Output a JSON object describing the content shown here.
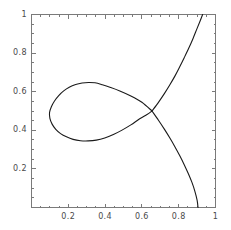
{
  "figure": {
    "title": "",
    "frame_color": "#7a7a7a",
    "curve_color": "#1a1a1a",
    "background": "#ffffff",
    "tick_label_color": "#4a4a4a"
  },
  "chart_data": {
    "type": "line",
    "title": "",
    "xlabel": "",
    "ylabel": "",
    "xlim": [
      0,
      1
    ],
    "ylim": [
      0,
      1
    ],
    "grid": false,
    "legend": null,
    "xticks": [
      0.2,
      0.4,
      0.6,
      0.8,
      1
    ],
    "xtick_labels": [
      "0.2",
      "0.4",
      "0.6",
      "0.8",
      "1"
    ],
    "yticks": [
      0.2,
      0.4,
      0.6,
      0.8,
      1
    ],
    "ytick_labels": [
      "0.2",
      "0.4",
      "0.6",
      "0.8",
      "1"
    ],
    "annotations": [
      {
        "name": "self-intersection",
        "x": 0.655,
        "y": 0.5
      },
      {
        "name": "loop-leftmost",
        "x": 0.09,
        "y": 0.49
      },
      {
        "name": "loop-top",
        "x": 0.325,
        "y": 0.648
      },
      {
        "name": "loop-bottom",
        "x": 0.34,
        "y": 0.345
      },
      {
        "name": "upper-branch-exit-top",
        "x": 0.93,
        "y": 1.0
      },
      {
        "name": "lower-branch-exit-bottom",
        "x": 0.905,
        "y": 0.0
      }
    ],
    "series": [
      {
        "name": "loop-branch",
        "closed": true,
        "points": [
          [
            0.655,
            0.5
          ],
          [
            0.6,
            0.545
          ],
          [
            0.54,
            0.578
          ],
          [
            0.48,
            0.604
          ],
          [
            0.43,
            0.622
          ],
          [
            0.385,
            0.636
          ],
          [
            0.345,
            0.646
          ],
          [
            0.31,
            0.648
          ],
          [
            0.275,
            0.645
          ],
          [
            0.24,
            0.637
          ],
          [
            0.205,
            0.623
          ],
          [
            0.175,
            0.604
          ],
          [
            0.148,
            0.58
          ],
          [
            0.125,
            0.552
          ],
          [
            0.108,
            0.522
          ],
          [
            0.098,
            0.492
          ],
          [
            0.1,
            0.462
          ],
          [
            0.112,
            0.432
          ],
          [
            0.132,
            0.405
          ],
          [
            0.158,
            0.383
          ],
          [
            0.19,
            0.366
          ],
          [
            0.226,
            0.353
          ],
          [
            0.266,
            0.346
          ],
          [
            0.308,
            0.345
          ],
          [
            0.352,
            0.349
          ],
          [
            0.398,
            0.36
          ],
          [
            0.445,
            0.378
          ],
          [
            0.492,
            0.401
          ],
          [
            0.54,
            0.428
          ],
          [
            0.588,
            0.46
          ],
          [
            0.628,
            0.482
          ],
          [
            0.655,
            0.5
          ]
        ]
      },
      {
        "name": "upper-branch",
        "closed": false,
        "points": [
          [
            0.655,
            0.5
          ],
          [
            0.69,
            0.545
          ],
          [
            0.722,
            0.59
          ],
          [
            0.752,
            0.636
          ],
          [
            0.78,
            0.682
          ],
          [
            0.805,
            0.728
          ],
          [
            0.83,
            0.776
          ],
          [
            0.855,
            0.826
          ],
          [
            0.878,
            0.876
          ],
          [
            0.9,
            0.928
          ],
          [
            0.918,
            0.97
          ],
          [
            0.93,
            1.0
          ]
        ]
      },
      {
        "name": "lower-branch",
        "closed": false,
        "points": [
          [
            0.655,
            0.5
          ],
          [
            0.69,
            0.452
          ],
          [
            0.722,
            0.406
          ],
          [
            0.752,
            0.36
          ],
          [
            0.78,
            0.314
          ],
          [
            0.806,
            0.268
          ],
          [
            0.83,
            0.222
          ],
          [
            0.852,
            0.176
          ],
          [
            0.872,
            0.13
          ],
          [
            0.888,
            0.084
          ],
          [
            0.9,
            0.038
          ],
          [
            0.905,
            0.0
          ]
        ]
      }
    ]
  }
}
